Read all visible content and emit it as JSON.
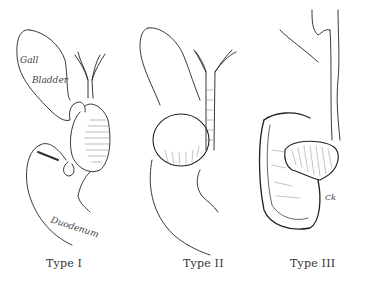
{
  "figure": {
    "panels": [
      {
        "label": "Type I",
        "annotations": [
          "Gall",
          "Bladder",
          "Duodenum"
        ]
      },
      {
        "label": "Type II"
      },
      {
        "label": "Type III",
        "signature": "Ck"
      }
    ]
  }
}
